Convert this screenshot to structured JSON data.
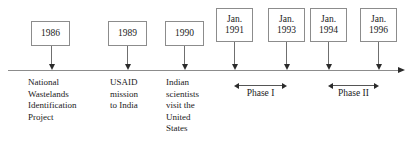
{
  "figure": {
    "type": "timeline",
    "title": "",
    "axis": {
      "line_color": "#8c8c8c",
      "start_x": 8,
      "end_x": 398,
      "y": 70,
      "direction": "left-to-right",
      "arrowhead": "right"
    }
  },
  "milestones": [
    {
      "id": "m1986",
      "box_lines": [
        "1986"
      ],
      "date_label": "1986",
      "tick_x": 51,
      "box": {
        "x": 31,
        "y": 21,
        "w": 39,
        "h": 25
      },
      "event_label": "National\nWastelands\nIdentification\nProject",
      "label_x": 28,
      "label_y": 77
    },
    {
      "id": "m1989",
      "box_lines": [
        "1989"
      ],
      "date_label": "1989",
      "tick_x": 127,
      "box": {
        "x": 108,
        "y": 21,
        "w": 39,
        "h": 25
      },
      "event_label": "USAID\nmission\nto India",
      "label_x": 110,
      "label_y": 77
    },
    {
      "id": "m1990",
      "box_lines": [
        "1990"
      ],
      "date_label": "1990",
      "tick_x": 184,
      "box": {
        "x": 165,
        "y": 21,
        "w": 39,
        "h": 25
      },
      "event_label": "Indian\nscientists\nvisit the\nUnited\nStates",
      "label_x": 166,
      "label_y": 77
    },
    {
      "id": "m1991",
      "box_lines": [
        "Jan.",
        "1991"
      ],
      "date_label": "Jan. 1991",
      "tick_x": 234,
      "box": {
        "x": 216,
        "y": 8,
        "w": 37,
        "h": 34
      },
      "event_label": "",
      "label_x": 0,
      "label_y": 0
    },
    {
      "id": "m1993",
      "box_lines": [
        "Jan.",
        "1993"
      ],
      "date_label": "Jan. 1993",
      "tick_x": 286,
      "box": {
        "x": 268,
        "y": 8,
        "w": 37,
        "h": 34
      },
      "event_label": "",
      "label_x": 0,
      "label_y": 0
    },
    {
      "id": "m1994",
      "box_lines": [
        "Jan.",
        "1994"
      ],
      "date_label": "Jan. 1994",
      "tick_x": 328,
      "box": {
        "x": 310,
        "y": 8,
        "w": 37,
        "h": 34
      },
      "event_label": "",
      "label_x": 0,
      "label_y": 0
    },
    {
      "id": "m1996",
      "box_lines": [
        "Jan.",
        "1996"
      ],
      "date_label": "Jan. 1996",
      "tick_x": 378,
      "box": {
        "x": 360,
        "y": 8,
        "w": 37,
        "h": 34
      },
      "event_label": "",
      "label_x": 0,
      "label_y": 0
    }
  ],
  "phases": [
    {
      "id": "phase-1",
      "label": "Phase I",
      "start_milestone": "Jan. 1991",
      "end_milestone": "Jan. 1993",
      "start_x": 234,
      "end_x": 287,
      "bar_y": 85,
      "label_y": 88
    },
    {
      "id": "phase-2",
      "label": "Phase II",
      "start_milestone": "Jan. 1994",
      "end_milestone": "Jan. 1996",
      "start_x": 328,
      "end_x": 379,
      "bar_y": 85,
      "label_y": 88
    }
  ],
  "colors": {
    "background": "#ffffff",
    "text": "#1a1a1a",
    "box_border": "#8c8c8c",
    "axis": "#8c8c8c",
    "arrow": "#2b2b2b",
    "stem": "#6f6f6f"
  }
}
